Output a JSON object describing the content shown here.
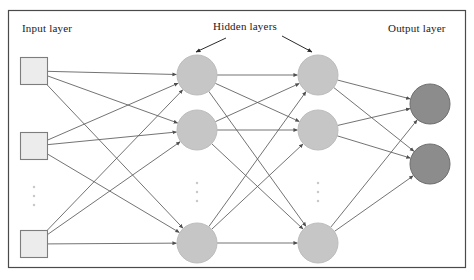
{
  "figure": {
    "type": "neural-network-architecture-diagram",
    "background_color": "#ffffff",
    "border_color": "#4a4a4a"
  },
  "labels": {
    "input": "Input layer",
    "hidden": "Hidden layers",
    "output": "Output layer"
  },
  "legend_arrows": [
    {
      "name": "hidden-label-arrow-left",
      "from": [
        226,
        38
      ],
      "to": [
        196,
        52
      ]
    },
    {
      "name": "hidden-label-arrow-right",
      "from": [
        282,
        36
      ],
      "to": [
        312,
        52
      ]
    }
  ],
  "palette": {
    "input_node_fill": "#ececec",
    "input_node_stroke": "#7d7d7d",
    "hidden_node_fill": "#c6c6c6",
    "hidden_node_stroke": "#bdbdbd",
    "output_node_fill": "#8c8c8c",
    "output_node_stroke": "#6e6e6e",
    "edge_color": "#5a5a5a",
    "ellipsis_color": "#c9c9c9",
    "text_color": "#1a1a1a"
  },
  "geometry": {
    "frame": {
      "x": 8,
      "y": 10,
      "width": 458,
      "height": 258
    },
    "node_radius": 20,
    "square_size": 27
  },
  "layers": [
    {
      "name": "input-layer",
      "shape": "square",
      "x": 34,
      "nodes": [
        {
          "name": "input-node-1",
          "cx": 34,
          "cy": 71
        },
        {
          "name": "input-node-2",
          "cx": 34,
          "cy": 146
        },
        {
          "name": "input-node-3",
          "cx": 34,
          "cy": 244
        }
      ],
      "ellipsis": {
        "cx": 34,
        "cy": 196
      }
    },
    {
      "name": "hidden-layer-1",
      "shape": "circle",
      "x": 197,
      "nodes": [
        {
          "name": "hidden1-node-1",
          "cx": 197,
          "cy": 75
        },
        {
          "name": "hidden1-node-2",
          "cx": 197,
          "cy": 130
        },
        {
          "name": "hidden1-node-3",
          "cx": 197,
          "cy": 243
        }
      ],
      "ellipsis": {
        "cx": 197,
        "cy": 192
      }
    },
    {
      "name": "hidden-layer-2",
      "shape": "circle",
      "x": 318,
      "nodes": [
        {
          "name": "hidden2-node-1",
          "cx": 318,
          "cy": 75
        },
        {
          "name": "hidden2-node-2",
          "cx": 318,
          "cy": 130
        },
        {
          "name": "hidden2-node-3",
          "cx": 318,
          "cy": 243
        }
      ],
      "ellipsis": {
        "cx": 318,
        "cy": 192
      }
    },
    {
      "name": "output-layer",
      "shape": "circle",
      "x": 430,
      "nodes": [
        {
          "name": "output-node-1",
          "cx": 430,
          "cy": 104
        },
        {
          "name": "output-node-2",
          "cx": 430,
          "cy": 164
        }
      ],
      "ellipsis": null
    }
  ],
  "connections": {
    "style": "fully-connected-directed",
    "arrowheads": true,
    "groups": [
      {
        "name": "input-to-hidden1",
        "from": "input-layer",
        "to": "hidden-layer-1",
        "count": 9
      },
      {
        "name": "hidden1-to-hidden2",
        "from": "hidden-layer-1",
        "to": "hidden-layer-2",
        "count": 9
      },
      {
        "name": "hidden2-to-output",
        "from": "hidden-layer-2",
        "to": "output-layer",
        "count": 6
      }
    ]
  }
}
